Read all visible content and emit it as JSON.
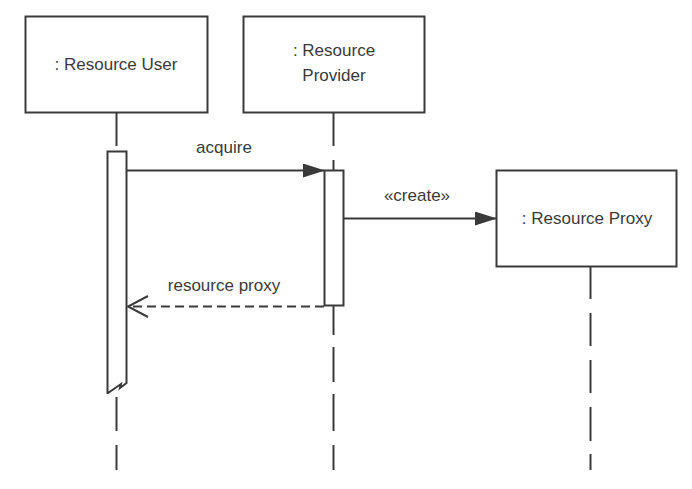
{
  "diagram": {
    "type": "uml-sequence",
    "colors": {
      "stroke": "#3a3a3a",
      "background": "#ffffff",
      "text": "#3a3a3a"
    },
    "participants": [
      {
        "id": "user",
        "label_lines": [
          ": Resource User"
        ]
      },
      {
        "id": "provider",
        "label_lines": [
          ": Resource",
          "Provider"
        ]
      },
      {
        "id": "proxy",
        "label_lines": [
          ": Resource Proxy"
        ]
      }
    ],
    "messages": [
      {
        "from": "user",
        "to": "provider",
        "label": "acquire",
        "kind": "synchronous-call"
      },
      {
        "from": "provider",
        "to": "proxy",
        "label": "«create»",
        "kind": "create"
      },
      {
        "from": "provider",
        "to": "user",
        "label": "resource proxy",
        "kind": "return"
      }
    ]
  }
}
